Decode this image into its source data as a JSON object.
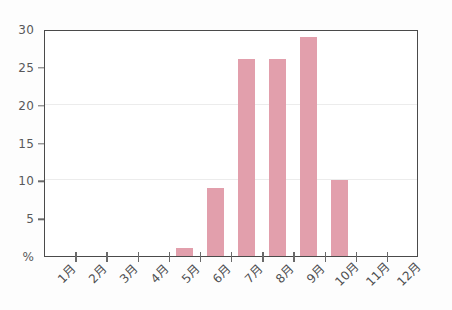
{
  "chart_data": {
    "type": "bar",
    "title": "",
    "subtitle": "",
    "xlabel": "",
    "ylabel": "%",
    "categories": [
      "1月",
      "2月",
      "3月",
      "4月",
      "5月",
      "6月",
      "7月",
      "8月",
      "9月",
      "10月",
      "11月",
      "12月"
    ],
    "values": [
      0,
      0,
      0,
      0,
      1,
      9,
      26,
      26,
      29,
      10,
      0,
      0
    ],
    "series": [
      {
        "name": "",
        "values": [
          0,
          0,
          0,
          0,
          1,
          9,
          26,
          26,
          29,
          10,
          0,
          0
        ]
      }
    ],
    "ylim": [
      0,
      30
    ],
    "y_ticks": [
      0,
      5,
      10,
      15,
      20,
      25,
      30
    ],
    "y_tick_labels": [
      "%",
      "5",
      "10",
      "15",
      "20",
      "25",
      "30"
    ],
    "gridlines": [
      10,
      20
    ],
    "grid": true,
    "legend": null,
    "legend_position": "none",
    "annotations": [],
    "bar_color": "#e29fac",
    "axis_color": "#4a4a4a",
    "grid_color": "#ececec",
    "tick_label_color": "#58585a"
  }
}
